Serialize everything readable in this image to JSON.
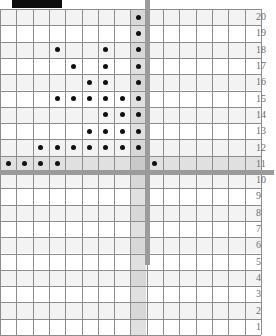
{
  "figure": {
    "redaction_bar": {
      "label": "redacted-title-bar",
      "color": "#0d0d0d"
    },
    "axis_color": "#9b9b9b",
    "grid_color": "#8d8d8d",
    "dot_color": "#111111"
  },
  "chart_data": {
    "type": "scatter",
    "title": "",
    "subtitle": "",
    "xlabel": "",
    "ylabel": "",
    "grid": true,
    "legend": null,
    "xlim": [
      -8,
      8
    ],
    "ylim": [
      1,
      20
    ],
    "y_tick_labels": [
      "20",
      "19",
      "18",
      "17",
      "16",
      "15",
      "14",
      "13",
      "12",
      "11",
      "10",
      "9",
      "8",
      "7",
      "6",
      "5",
      "4",
      "3",
      "2",
      "1"
    ],
    "x_tick_labels": [],
    "y_axis_position": "right",
    "axes_lines": {
      "vertical_x": 0,
      "horizontal_y": 11.5
    },
    "note": "Dots plotted on integer grid cells. x measured in cells left of the vertical axis (col 1 = leftmost cell), y = row label.",
    "points": [
      {
        "col": 8,
        "row": 20
      },
      {
        "col": 8,
        "row": 19
      },
      {
        "col": 3,
        "row": 18
      },
      {
        "col": 6,
        "row": 18
      },
      {
        "col": 8,
        "row": 18
      },
      {
        "col": 4,
        "row": 17
      },
      {
        "col": 6,
        "row": 17
      },
      {
        "col": 8,
        "row": 17
      },
      {
        "col": 5,
        "row": 16
      },
      {
        "col": 6,
        "row": 16
      },
      {
        "col": 8,
        "row": 16
      },
      {
        "col": 3,
        "row": 15
      },
      {
        "col": 4,
        "row": 15
      },
      {
        "col": 5,
        "row": 15
      },
      {
        "col": 6,
        "row": 15
      },
      {
        "col": 7,
        "row": 15
      },
      {
        "col": 8,
        "row": 15
      },
      {
        "col": 6,
        "row": 14
      },
      {
        "col": 7,
        "row": 14
      },
      {
        "col": 8,
        "row": 14
      },
      {
        "col": 5,
        "row": 13
      },
      {
        "col": 6,
        "row": 13
      },
      {
        "col": 7,
        "row": 13
      },
      {
        "col": 8,
        "row": 13
      },
      {
        "col": 2,
        "row": 12
      },
      {
        "col": 3,
        "row": 12
      },
      {
        "col": 4,
        "row": 12
      },
      {
        "col": 5,
        "row": 12
      },
      {
        "col": 6,
        "row": 12
      },
      {
        "col": 7,
        "row": 12
      },
      {
        "col": 8,
        "row": 12
      },
      {
        "col": 0,
        "row": 11
      },
      {
        "col": 1,
        "row": 11
      },
      {
        "col": 2,
        "row": 11
      },
      {
        "col": 3,
        "row": 11
      },
      {
        "col": 9,
        "row": 11
      }
    ]
  },
  "geometry": {
    "cell": 16.3,
    "plot_left": 0,
    "plot_top": 9,
    "cols_total": 16,
    "rows_total": 20,
    "axis_col_index": 8,
    "axis_row_index": 9,
    "label_left": 256,
    "redaction": {
      "x": 12,
      "y": 0,
      "w": 50,
      "h": 8
    }
  }
}
